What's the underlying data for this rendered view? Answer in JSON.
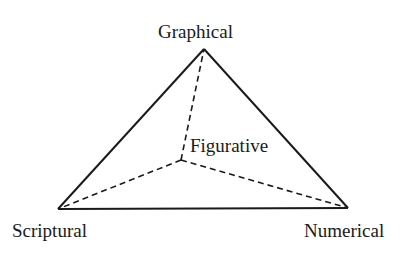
{
  "diagram": {
    "type": "triangle",
    "colors": {
      "stroke": "#1a1a1a",
      "background": "#ffffff"
    },
    "vertices": {
      "top": {
        "label": "Graphical",
        "x": 204,
        "y": 49
      },
      "bottom_left": {
        "label": "Scriptural",
        "x": 58,
        "y": 209
      },
      "bottom_right": {
        "label": "Numerical",
        "x": 348,
        "y": 208
      }
    },
    "inner_point": {
      "label": "Figurative",
      "x": 181,
      "y": 160
    },
    "edges": [
      {
        "from": "top",
        "to": "bottom_left",
        "style": "solid"
      },
      {
        "from": "top",
        "to": "bottom_right",
        "style": "solid"
      },
      {
        "from": "bottom_left",
        "to": "bottom_right",
        "style": "solid"
      },
      {
        "from": "inner_point",
        "to": "top",
        "style": "dashed"
      },
      {
        "from": "inner_point",
        "to": "bottom_left",
        "style": "dashed"
      },
      {
        "from": "inner_point",
        "to": "bottom_right",
        "style": "dashed"
      }
    ]
  }
}
